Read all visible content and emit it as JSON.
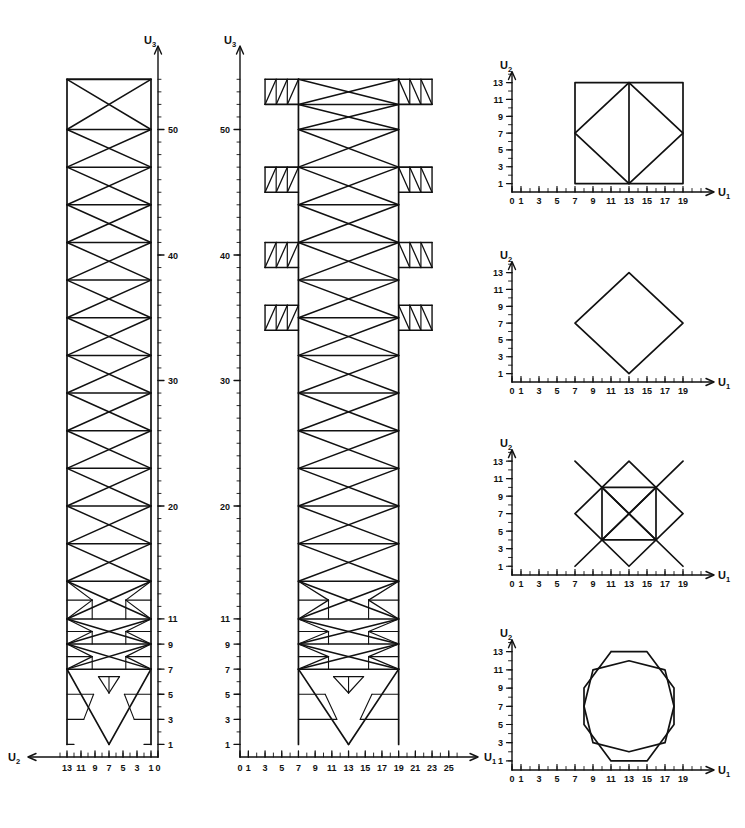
{
  "figure": {
    "background": "#ffffff",
    "line_color": "#111111",
    "panels": [
      {
        "id": "side-elevation-u2",
        "name": "Side elevation (U2 - U3 plane)",
        "x_axis": {
          "label": "U2",
          "direction": "left",
          "ticks": [
            0,
            1,
            3,
            5,
            7,
            9,
            11,
            13
          ],
          "min": 0,
          "max": 14
        },
        "y_axis": {
          "label": "U3",
          "direction": "up",
          "ticks": [
            1,
            3,
            5,
            7,
            9,
            11,
            20,
            30,
            40,
            50
          ],
          "min": 0,
          "max": 55
        }
      },
      {
        "id": "front-elevation-u1",
        "name": "Front elevation (U1 - U3 plane)",
        "x_axis": {
          "label": "U1",
          "direction": "right",
          "ticks": [
            0,
            1,
            3,
            5,
            7,
            9,
            11,
            13,
            15,
            17,
            19,
            21,
            23,
            25
          ],
          "min": 0,
          "max": 26
        },
        "y_axis": {
          "label": "U3",
          "direction": "up",
          "ticks": [
            1,
            3,
            5,
            7,
            9,
            11,
            20,
            30,
            40,
            50
          ],
          "min": 0,
          "max": 55
        }
      },
      {
        "id": "plan-section-a",
        "name": "Plan section A (square with inscribed diamond)",
        "x_axis": {
          "label": "U1",
          "direction": "right",
          "ticks": [
            0,
            1,
            3,
            5,
            7,
            9,
            11,
            13,
            15,
            17,
            19
          ],
          "min": 0,
          "max": 21
        },
        "y_axis": {
          "label": "U2",
          "direction": "up",
          "ticks": [
            1,
            3,
            5,
            7,
            9,
            11,
            13
          ],
          "min": 0,
          "max": 14
        }
      },
      {
        "id": "plan-section-b",
        "name": "Plan section B (plain diamond)",
        "x_axis": {
          "label": "U1",
          "direction": "right",
          "ticks": [
            0,
            1,
            3,
            5,
            7,
            9,
            11,
            13,
            15,
            17,
            19
          ],
          "min": 0,
          "max": 21
        },
        "y_axis": {
          "label": "U2",
          "direction": "up",
          "ticks": [
            1,
            3,
            5,
            7,
            9,
            11,
            13
          ],
          "min": 0,
          "max": 14
        }
      },
      {
        "id": "plan-section-c",
        "name": "Plan section C (diamond with inscribed square and crossed arms)",
        "x_axis": {
          "label": "U1",
          "direction": "right",
          "ticks": [
            0,
            1,
            3,
            5,
            7,
            9,
            11,
            13,
            15,
            17,
            19
          ],
          "min": 0,
          "max": 21
        },
        "y_axis": {
          "label": "U2",
          "direction": "up",
          "ticks": [
            1,
            3,
            5,
            7,
            9,
            11,
            13
          ],
          "min": 0,
          "max": 14
        }
      },
      {
        "id": "plan-section-d",
        "name": "Plan section D (two interlocking octagons)",
        "x_axis": {
          "label": "U1",
          "direction": "right",
          "ticks": [
            0,
            1,
            3,
            5,
            7,
            9,
            11,
            13,
            15,
            17,
            19
          ],
          "min": 0,
          "max": 21
        },
        "y_axis": {
          "label": "U2",
          "direction": "up",
          "ticks": [
            1,
            3,
            5,
            7,
            9,
            11,
            13
          ],
          "min": 0,
          "max": 14
        }
      }
    ]
  },
  "chart_data": {
    "type": "line",
    "subplots": [
      {
        "id": "side-elevation-u2",
        "xlabel": "U2",
        "ylabel": "U3",
        "xlim": [
          14,
          0
        ],
        "ylim": [
          0,
          55
        ],
        "xticks": [
          0,
          1,
          3,
          5,
          7,
          9,
          11,
          13
        ],
        "yticks": [
          1,
          3,
          5,
          7,
          9,
          11,
          20,
          30,
          40,
          50
        ],
        "grid": false,
        "description": "Tall slender tower of constant width between U2 = 1 and U2 = 13, rising from U3 = 1 to U3 = 54. Regular X-braced bays with horizontal chords; lower bays below U3 = 12 carry additional fine triangular sub-bracing; base splits into two inclined legs forming a V notch between U3 = 1 and U3 = 7.",
        "body_x_range": [
          1,
          13
        ],
        "body_z_range": [
          1,
          54
        ],
        "chord_levels": [
          1,
          3,
          5,
          7,
          9,
          11,
          14,
          17,
          20,
          23,
          26,
          29,
          32,
          35,
          38,
          41,
          44,
          47,
          50,
          54
        ],
        "base_notch_apex": [
          7,
          7
        ],
        "base_feet": [
          1,
          13
        ]
      },
      {
        "id": "front-elevation-u1",
        "xlabel": "U1",
        "ylabel": "U3",
        "xlim": [
          0,
          26
        ],
        "ylim": [
          0,
          55
        ],
        "xticks": [
          0,
          1,
          3,
          5,
          7,
          9,
          11,
          13,
          15,
          17,
          19,
          21,
          23,
          25
        ],
        "yticks": [
          1,
          3,
          5,
          7,
          9,
          11,
          20,
          30,
          40,
          50
        ],
        "grid": false,
        "description": "Same tower seen at right angles. Central shaft between U1 = 7 and U1 = 19, rising from U3 = 1 to U3 = 54, with four pairs of cantilevered triangulated platform arms extending to U1 = 3 and U1 = 23.",
        "core_x_range": [
          7,
          19
        ],
        "core_z_range": [
          1,
          54
        ],
        "arm_levels": [
          [
            52,
            54
          ],
          [
            45,
            47
          ],
          [
            39,
            41
          ],
          [
            34,
            36
          ]
        ],
        "arm_x_extent": [
          3,
          23
        ],
        "base_notch_apex": [
          13,
          7
        ],
        "base_feet": [
          7,
          19
        ]
      },
      {
        "id": "plan-section-a",
        "xlabel": "U1",
        "ylabel": "U2",
        "xlim": [
          0,
          21
        ],
        "ylim": [
          0,
          14
        ],
        "xticks": [
          0,
          1,
          3,
          5,
          7,
          9,
          11,
          13,
          15,
          17,
          19
        ],
        "yticks": [
          1,
          3,
          5,
          7,
          9,
          11,
          13
        ],
        "grid": false,
        "description": "Square outer frame with an inscribed diamond and a central vertical tie.",
        "shapes": [
          {
            "name": "outer-square",
            "points": [
              [
                7,
                1
              ],
              [
                19,
                1
              ],
              [
                19,
                13
              ],
              [
                7,
                13
              ],
              [
                7,
                1
              ]
            ]
          },
          {
            "name": "inscribed-diamond",
            "points": [
              [
                7,
                7
              ],
              [
                13,
                13
              ],
              [
                19,
                7
              ],
              [
                13,
                1
              ],
              [
                7,
                7
              ]
            ]
          },
          {
            "name": "central-tie",
            "points": [
              [
                13,
                1
              ],
              [
                13,
                13
              ]
            ]
          }
        ]
      },
      {
        "id": "plan-section-b",
        "xlabel": "U1",
        "ylabel": "U2",
        "xlim": [
          0,
          21
        ],
        "ylim": [
          0,
          14
        ],
        "xticks": [
          0,
          1,
          3,
          5,
          7,
          9,
          11,
          13,
          15,
          17,
          19
        ],
        "yticks": [
          1,
          3,
          5,
          7,
          9,
          11,
          13
        ],
        "grid": false,
        "description": "Plain diamond with vertices on the mid-points of the former square.",
        "shapes": [
          {
            "name": "diamond",
            "points": [
              [
                7,
                7
              ],
              [
                13,
                13
              ],
              [
                19,
                7
              ],
              [
                13,
                1
              ],
              [
                7,
                7
              ]
            ]
          }
        ]
      },
      {
        "id": "plan-section-c",
        "xlabel": "U1",
        "ylabel": "U2",
        "xlim": [
          0,
          21
        ],
        "ylim": [
          0,
          14
        ],
        "xticks": [
          0,
          1,
          3,
          5,
          7,
          9,
          11,
          13,
          15,
          17,
          19
        ],
        "yticks": [
          1,
          3,
          5,
          7,
          9,
          11,
          13
        ],
        "grid": false,
        "description": "Diamond with an inscribed square; the square diagonals continue outwards past the diamond edges as four crossed cantilever arms.",
        "shapes": [
          {
            "name": "diamond",
            "points": [
              [
                7,
                7
              ],
              [
                13,
                13
              ],
              [
                19,
                7
              ],
              [
                13,
                1
              ],
              [
                7,
                7
              ]
            ]
          },
          {
            "name": "inner-square",
            "points": [
              [
                10,
                4
              ],
              [
                16,
                4
              ],
              [
                16,
                10
              ],
              [
                10,
                10
              ],
              [
                10,
                4
              ]
            ]
          },
          {
            "name": "arm-nw",
            "points": [
              [
                16,
                4
              ],
              [
                7,
                13
              ]
            ]
          },
          {
            "name": "arm-ne",
            "points": [
              [
                10,
                4
              ],
              [
                19,
                13
              ]
            ]
          },
          {
            "name": "arm-sw",
            "points": [
              [
                16,
                10
              ],
              [
                7,
                1
              ]
            ]
          },
          {
            "name": "arm-se",
            "points": [
              [
                10,
                10
              ],
              [
                19,
                1
              ]
            ]
          }
        ]
      },
      {
        "id": "plan-section-d",
        "xlabel": "U1",
        "ylabel": "U2",
        "xlim": [
          0,
          21
        ],
        "ylim": [
          0,
          14
        ],
        "xticks": [
          0,
          1,
          3,
          5,
          7,
          9,
          11,
          13,
          15,
          17,
          19
        ],
        "yticks": [
          1,
          3,
          5,
          7,
          9,
          11,
          13
        ],
        "grid": false,
        "description": "Two interlocking octagons forming an eight-pointed star, with four outer crossed arms reaching the corners of the field.",
        "shapes": [
          {
            "name": "octagon-primary",
            "points": [
              [
                9,
                11
              ],
              [
                13,
                12
              ],
              [
                17,
                11
              ],
              [
                18,
                7
              ],
              [
                17,
                3
              ],
              [
                13,
                2
              ],
              [
                9,
                3
              ],
              [
                8,
                7
              ],
              [
                9,
                11
              ]
            ]
          },
          {
            "name": "octagon-secondary",
            "points": [
              [
                11,
                13
              ],
              [
                15,
                13
              ],
              [
                18,
                9
              ],
              [
                18,
                5
              ],
              [
                15,
                1
              ],
              [
                11,
                1
              ],
              [
                8,
                5
              ],
              [
                8,
                9
              ],
              [
                11,
                13
              ]
            ]
          }
        ]
      }
    ]
  }
}
